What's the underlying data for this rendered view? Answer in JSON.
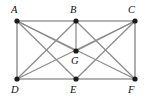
{
  "figure": {
    "kind": "undirected-graph-diagram",
    "background_color": "#ffffff",
    "edge_color": "#8c8c8c",
    "frame_edge_color": "#9a9a9a",
    "vertex_color": "#1a1a1a",
    "label_color": "#111111",
    "vertex_radius": 2.6,
    "width": 146,
    "height": 100
  },
  "vertices": [
    {
      "id": "A",
      "label": "A",
      "x": 17,
      "y": 21,
      "label_x": 11,
      "label_y": 5,
      "degree": 5
    },
    {
      "id": "B",
      "label": "B",
      "x": 76,
      "y": 21,
      "label_x": 70,
      "label_y": 5,
      "degree": 5
    },
    {
      "id": "C",
      "label": "C",
      "x": 135,
      "y": 21,
      "label_x": 128,
      "label_y": 5,
      "degree": 5
    },
    {
      "id": "D",
      "label": "D",
      "x": 17,
      "y": 79,
      "label_x": 11,
      "label_y": 85,
      "degree": 4
    },
    {
      "id": "E",
      "label": "E",
      "x": 76,
      "y": 79,
      "label_x": 70,
      "label_y": 85,
      "degree": 4
    },
    {
      "id": "F",
      "label": "F",
      "x": 135,
      "y": 79,
      "label_x": 128,
      "label_y": 85,
      "degree": 4
    },
    {
      "id": "G",
      "label": "G",
      "x": 76,
      "y": 51,
      "label_x": 71,
      "label_y": 56,
      "degree": 3
    }
  ],
  "edges": [
    {
      "from": "A",
      "to": "B",
      "kind": "frame"
    },
    {
      "from": "B",
      "to": "C",
      "kind": "frame"
    },
    {
      "from": "A",
      "to": "D",
      "kind": "frame"
    },
    {
      "from": "C",
      "to": "F",
      "kind": "frame"
    },
    {
      "from": "D",
      "to": "E",
      "kind": "frame"
    },
    {
      "from": "E",
      "to": "F",
      "kind": "frame"
    },
    {
      "from": "A",
      "to": "G",
      "kind": "chord"
    },
    {
      "from": "A",
      "to": "E",
      "kind": "chord"
    },
    {
      "from": "A",
      "to": "F",
      "kind": "chord"
    },
    {
      "from": "B",
      "to": "G",
      "kind": "chord"
    },
    {
      "from": "B",
      "to": "D",
      "kind": "chord"
    },
    {
      "from": "B",
      "to": "F",
      "kind": "chord"
    },
    {
      "from": "C",
      "to": "G",
      "kind": "chord"
    },
    {
      "from": "C",
      "to": "E",
      "kind": "chord"
    },
    {
      "from": "C",
      "to": "D",
      "kind": "chord"
    }
  ]
}
